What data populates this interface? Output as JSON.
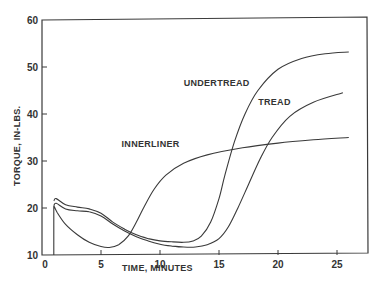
{
  "chart_data": {
    "type": "line",
    "title": "",
    "xlabel": "TIME, MINUTES",
    "ylabel": "TORQUE, IN-LBS.",
    "xlim": [
      0,
      27
    ],
    "ylim": [
      10,
      60
    ],
    "x_ticks": [
      0,
      5,
      10,
      15,
      20,
      25
    ],
    "y_ticks": [
      10,
      20,
      30,
      40,
      50,
      60
    ],
    "grid": false,
    "legend": "inline labels",
    "series": [
      {
        "name": "INNERLINER",
        "x": [
          1,
          1,
          1.3,
          2,
          3,
          4,
          5,
          5.7,
          6.5,
          7.3,
          8,
          8.7,
          9.5,
          10.5,
          12,
          14,
          17,
          20,
          23,
          26
        ],
        "values": [
          10,
          20.5,
          19,
          16.5,
          14.3,
          12.7,
          11.8,
          11.6,
          12.2,
          14,
          17,
          20.5,
          24,
          27,
          29.5,
          31.3,
          32.8,
          33.8,
          34.5,
          35
        ]
      },
      {
        "name": "UNDERTREAD",
        "x": [
          1,
          1.2,
          2,
          3,
          4,
          5,
          6,
          7,
          8,
          9,
          10,
          11,
          12,
          12.8,
          13.5,
          14.3,
          15,
          15.5,
          16.3,
          17.2,
          18.3,
          20,
          22,
          24,
          26
        ],
        "values": [
          21.5,
          22,
          20.7,
          20.2,
          19.8,
          18.9,
          17,
          15.5,
          14.3,
          13.5,
          13,
          12.8,
          12.7,
          13,
          14,
          17,
          22,
          27,
          34,
          40,
          45,
          49.5,
          51.8,
          52.8,
          53.2
        ]
      },
      {
        "name": "TREAD",
        "x": [
          1,
          1.2,
          2,
          3,
          4,
          5,
          6,
          7,
          8,
          9,
          10,
          11,
          12,
          13,
          14,
          15,
          15.8,
          16.6,
          17.5,
          18.5,
          19.5,
          21,
          23,
          25.5
        ],
        "values": [
          20.5,
          21,
          19.8,
          19.4,
          19.2,
          18.3,
          16.6,
          15.1,
          13.9,
          13,
          12.3,
          11.9,
          11.7,
          11.7,
          12.2,
          13.5,
          16,
          20,
          25,
          30.5,
          35,
          39.5,
          42.5,
          44.5
        ]
      }
    ],
    "annotations": [
      {
        "text": "UNDERTREAD",
        "x": 14.8,
        "y": 46
      },
      {
        "text": "TREAD",
        "x": 19.7,
        "y": 42
      },
      {
        "text": "INNERLINER",
        "x": 9.2,
        "y": 33
      }
    ]
  },
  "axes": {
    "xlabel": "TIME, MINUTES",
    "ylabel": "TORQUE, IN-LBS."
  }
}
